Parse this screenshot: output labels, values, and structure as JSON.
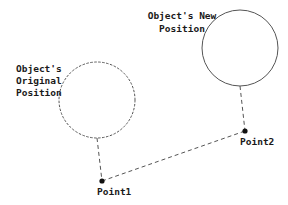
{
  "diagram": {
    "colors": {
      "background": "#ffffff",
      "stroke": "#555555",
      "text": "#1a1a1a",
      "point": "#111111"
    },
    "original_object": {
      "label_lines": [
        "Object's",
        "Original",
        "Position"
      ],
      "circle": {
        "cx": 97,
        "cy": 100,
        "r": 38,
        "style": "dashed"
      }
    },
    "new_object": {
      "label_lines": [
        "Object's New",
        "Position"
      ],
      "circle": {
        "cx": 240,
        "cy": 48,
        "r": 38,
        "style": "solid"
      }
    },
    "points": [
      {
        "name": "Point1",
        "x": 102,
        "y": 181
      },
      {
        "name": "Point2",
        "x": 245,
        "y": 131
      }
    ],
    "connectors": [
      {
        "from": "original_object.bottom",
        "to": "Point1",
        "style": "dashed"
      },
      {
        "from": "Point1",
        "to": "Point2",
        "style": "dashed"
      },
      {
        "from": "new_object.bottom",
        "to": "Point2",
        "style": "dashed"
      }
    ]
  }
}
